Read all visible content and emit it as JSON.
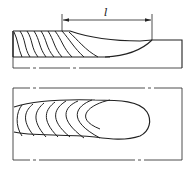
{
  "diagram": {
    "type": "technical-drawing",
    "dimension": {
      "label": "l"
    },
    "views": [
      {
        "name": "section-view"
      },
      {
        "name": "plan-view"
      }
    ],
    "colors": {
      "line": "#222222",
      "background": "#ffffff"
    }
  }
}
